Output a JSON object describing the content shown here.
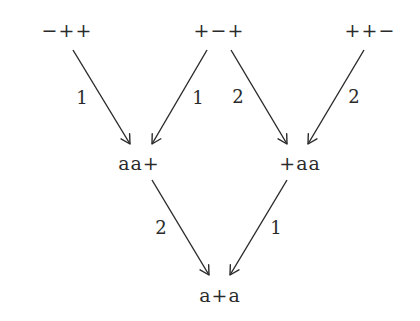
{
  "diagram": {
    "type": "directed-graph",
    "nodes": [
      {
        "id": "n1",
        "label": "−++",
        "x": 67,
        "y": 30
      },
      {
        "id": "n2",
        "label": "+−+",
        "x": 219,
        "y": 30
      },
      {
        "id": "n3",
        "label": "++−",
        "x": 370,
        "y": 30
      },
      {
        "id": "n4",
        "label": "aa+",
        "x": 139,
        "y": 163
      },
      {
        "id": "n5",
        "label": "+aa",
        "x": 300,
        "y": 163
      },
      {
        "id": "n6",
        "label": "a+a",
        "x": 220,
        "y": 295
      }
    ],
    "edges": [
      {
        "from": "n1",
        "to": "n4",
        "label": "1",
        "x1": 73,
        "y1": 50,
        "x2": 130,
        "y2": 144,
        "lx": 82,
        "ly": 98
      },
      {
        "from": "n2",
        "to": "n4",
        "label": "1",
        "x1": 207,
        "y1": 50,
        "x2": 152,
        "y2": 144,
        "lx": 198,
        "ly": 98
      },
      {
        "from": "n2",
        "to": "n5",
        "label": "2",
        "x1": 231,
        "y1": 50,
        "x2": 287,
        "y2": 144,
        "lx": 238,
        "ly": 97
      },
      {
        "from": "n3",
        "to": "n5",
        "label": "2",
        "x1": 364,
        "y1": 50,
        "x2": 308,
        "y2": 144,
        "lx": 354,
        "ly": 97
      },
      {
        "from": "n4",
        "to": "n6",
        "label": "2",
        "x1": 152,
        "y1": 180,
        "x2": 209,
        "y2": 275,
        "lx": 161,
        "ly": 228
      },
      {
        "from": "n5",
        "to": "n6",
        "label": "1",
        "x1": 287,
        "y1": 180,
        "x2": 230,
        "y2": 275,
        "lx": 276,
        "ly": 228
      }
    ],
    "colors": {
      "stroke": "#2a2a2a",
      "text": "#2a2a2a",
      "background": "#ffffff"
    }
  }
}
